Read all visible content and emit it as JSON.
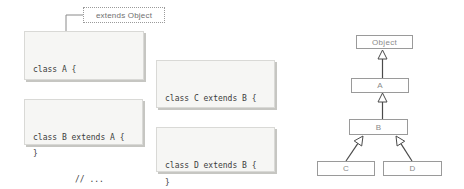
{
  "callout": {
    "label": "extends Object"
  },
  "code_boxes": [
    {
      "name": "class-a",
      "lines": [
        "class A {",
        "// ...",
        "}"
      ]
    },
    {
      "name": "class-b",
      "lines": [
        "class B extends A {",
        "// ...",
        "}"
      ]
    },
    {
      "name": "class-c",
      "lines": [
        "class C extends B {",
        "// ...",
        "}"
      ]
    },
    {
      "name": "class-d",
      "lines": [
        "class D extends B {",
        "// ...",
        "}"
      ]
    }
  ],
  "uml": {
    "nodes": [
      {
        "label": "Object"
      },
      {
        "label": "A"
      },
      {
        "label": "B"
      },
      {
        "label": "C"
      },
      {
        "label": "D"
      }
    ],
    "edges": [
      {
        "from": "A",
        "to": "Object",
        "type": "extends"
      },
      {
        "from": "B",
        "to": "A",
        "type": "extends"
      },
      {
        "from": "C",
        "to": "B",
        "type": "extends"
      },
      {
        "from": "D",
        "to": "B",
        "type": "extends"
      }
    ]
  },
  "colors": {
    "code_box_bg": "#f6f6f4",
    "code_box_border": "#d9d9d6",
    "code_box_shadow": "#c6c6c2",
    "code_text": "#3c3c3c",
    "uml_border": "#9a9a9a",
    "uml_text": "#8a8a8a",
    "arrow_line": "#4a4a4a",
    "callout_border": "#9a9a9a",
    "callout_text": "#6f6f6f"
  }
}
